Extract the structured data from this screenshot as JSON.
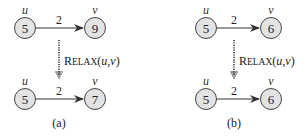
{
  "colors": {
    "node_fill": "#e3e3e3",
    "node_stroke": "#444444",
    "edge": "#333333",
    "background": "#ffffff"
  },
  "panels": [
    {
      "caption": "(a)",
      "relax_label": {
        "first": "R",
        "small_caps": "ELAX",
        "args_open": "(",
        "u": "u",
        "comma": ",",
        "v": "v",
        "args_close": ")"
      },
      "before": {
        "u": {
          "label": "u",
          "value": "5"
        },
        "v": {
          "label": "v",
          "value": "9"
        },
        "weight": "2"
      },
      "after": {
        "u": {
          "label": "u",
          "value": "5"
        },
        "v": {
          "label": "v",
          "value": "7"
        },
        "weight": "2"
      }
    },
    {
      "caption": "(b)",
      "relax_label": {
        "first": "R",
        "small_caps": "ELAX",
        "args_open": "(",
        "u": "u",
        "comma": ",",
        "v": "v",
        "args_close": ")"
      },
      "before": {
        "u": {
          "label": "u",
          "value": "5"
        },
        "v": {
          "label": "v",
          "value": "6"
        },
        "weight": "2"
      },
      "after": {
        "u": {
          "label": "u",
          "value": "5"
        },
        "v": {
          "label": "v",
          "value": "6"
        },
        "weight": "2"
      }
    }
  ]
}
